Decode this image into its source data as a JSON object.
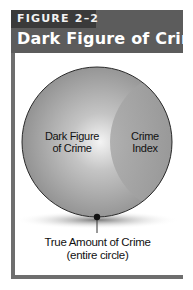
{
  "figure": {
    "label": "FIGURE 2–2",
    "title": "Dark Figure of Crime"
  },
  "diagram": {
    "regions": [
      {
        "name": "dark-figure",
        "line1": "Dark Figure",
        "line2": "of Crime"
      },
      {
        "name": "crime-index",
        "line1": "Crime",
        "line2": "Index"
      }
    ],
    "caption": {
      "line1": "True Amount of Crime",
      "line2": "(entire circle)"
    }
  },
  "colors": {
    "header_bg": "#5c5c5c",
    "tag_bg": "#3a3a3a",
    "frame": "#6e6e6e",
    "circle_fill": "#9a9a9a",
    "index_fill": "#8a8a8a"
  }
}
